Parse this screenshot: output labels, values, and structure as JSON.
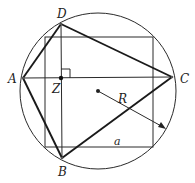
{
  "diagram": {
    "title": "",
    "background": "#ffffff",
    "stroke_color": "#222222",
    "circle": {
      "cx": 98,
      "cy": 91,
      "r": 78
    },
    "center": {
      "x": 98,
      "y": 91
    },
    "points": {
      "A": {
        "x": 23,
        "y": 78,
        "label": "A"
      },
      "B": {
        "x": 62,
        "y": 158,
        "label": "B"
      },
      "C": {
        "x": 172,
        "y": 77,
        "label": "C"
      },
      "D": {
        "x": 61,
        "y": 24,
        "label": "D"
      },
      "Z": {
        "x": 61,
        "y": 78,
        "label": "Z"
      }
    },
    "square": {
      "x1": 45,
      "y1": 37,
      "x2": 153,
      "y2": 147
    },
    "labels": {
      "A": "A",
      "B": "B",
      "C": "C",
      "D": "D",
      "Z": "Z",
      "R": "R",
      "a": "a"
    },
    "radius_label": "R",
    "side_label": "a",
    "radius_arrow": {
      "from": [
        98,
        91
      ],
      "to": [
        165,
        128
      ]
    },
    "right_angle_marker_at": "Z"
  }
}
